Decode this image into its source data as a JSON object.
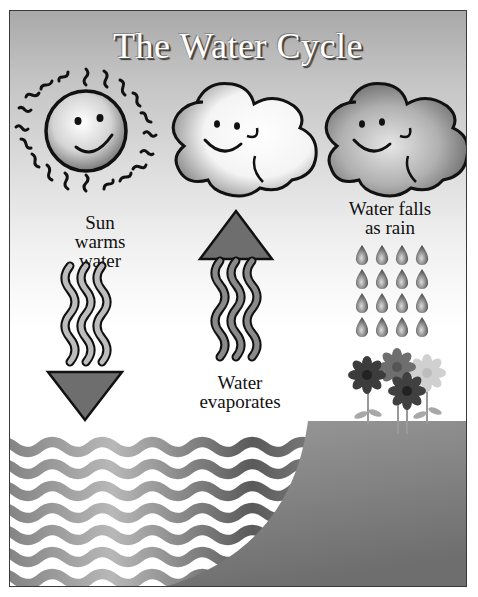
{
  "diagram": {
    "title": "The Water Cycle",
    "stages": [
      {
        "id": "sun",
        "icon": "smiling-sun-icon",
        "label_lines": [
          "Sun",
          "warms",
          "water"
        ],
        "arrow": "down"
      },
      {
        "id": "evaporation",
        "icon": "smiling-white-cloud-icon",
        "label_lines": [
          "Water",
          "evaporates"
        ],
        "arrow": "up"
      },
      {
        "id": "precipitation",
        "icon": "smiling-dark-cloud-icon",
        "label_lines": [
          "Water falls",
          "as rain"
        ],
        "raindrops": {
          "rows": 4,
          "cols": 4
        }
      }
    ],
    "scene": {
      "water": "wavy-water-waves",
      "land": "grassy-hill",
      "flowers": 4
    }
  },
  "colors": {
    "sky_top": "#a9a9a9",
    "sky_bottom": "#ffffff",
    "arrow_fill": "#6e6e6e",
    "outline": "#111111",
    "land": "#8a8a8a",
    "wave": "#8c8c8c"
  }
}
